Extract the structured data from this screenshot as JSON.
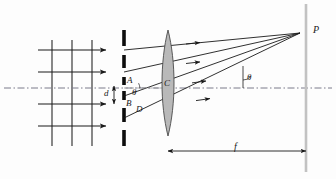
{
  "figure": {
    "kind": "optics-ray-diagram",
    "width": 336,
    "height": 179,
    "background": "#fdfdfd",
    "ink": "#1a1a1a",
    "lens_fill": "#b9b9b9",
    "axis_style": "dash-dot"
  },
  "labels": {
    "point_A": "A",
    "point_B": "B",
    "lens_C": "C",
    "point_D": "D",
    "slit_spacing_d": "d",
    "angle_theta_slit": "θ",
    "angle_theta_screen": "θ",
    "focal_point_P": "P",
    "focal_length_f": "f"
  },
  "geometry": {
    "axis_y": 88,
    "grating_x": 124,
    "lens_center_x": 168,
    "lens_top_y": 30,
    "lens_bottom_y": 136,
    "screen_x": 306,
    "focal_point": {
      "x": 300,
      "y": 33
    },
    "focal_arrow_y": 151,
    "focal_arrow_x1": 168,
    "focal_arrow_x2": 306,
    "wavefront_x": [
      52,
      72,
      92
    ],
    "incoming_ray_y": [
      50,
      72,
      104,
      126
    ],
    "slit_y": [
      50,
      72,
      88,
      96,
      118,
      140
    ],
    "ray_count": 4
  },
  "elements": {
    "incoming_wavefronts": "plane-wavefront-grid",
    "grating": "multi-slit-barrier",
    "lens": "biconvex-converging-lens",
    "screen": "focal-plane-screen",
    "rays": "diffracted-rays-to-focus"
  }
}
